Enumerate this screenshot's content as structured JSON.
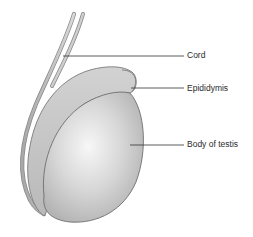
{
  "diagram": {
    "labels": [
      {
        "id": "cord",
        "text": "Cord"
      },
      {
        "id": "epididymis",
        "text": "Epididymis"
      },
      {
        "id": "body_of_testis",
        "text": "Body of testis"
      }
    ],
    "colors": {
      "testis_fill_light": "#f4f4f4",
      "testis_fill_dark": "#bdbdbd",
      "outline": "#6e6e6e",
      "epididymis_fill": "#c4c4c4",
      "leader_line": "#333333",
      "label_text": "#2a2a2a"
    }
  }
}
